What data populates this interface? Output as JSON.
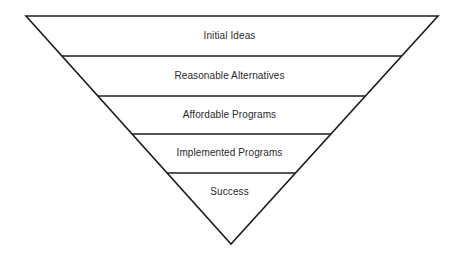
{
  "diagram": {
    "type": "inverted-funnel",
    "colors": {
      "background": "#ffffff",
      "stroke": "#1e1e1e",
      "text": "#2a2a2a"
    },
    "stages": [
      {
        "label": "Initial Ideas"
      },
      {
        "label": "Reasonable Alternatives"
      },
      {
        "label": "Affordable Programs"
      },
      {
        "label": "Implemented Programs"
      },
      {
        "label": "Success"
      }
    ]
  }
}
